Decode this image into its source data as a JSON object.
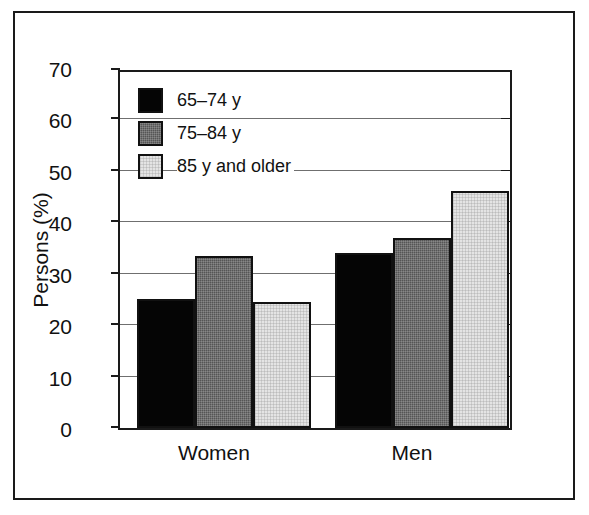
{
  "chart_data": {
    "type": "bar",
    "title": "",
    "xlabel": "",
    "ylabel": "Persons (%)",
    "categories": [
      "Women",
      "Men"
    ],
    "series": [
      {
        "name": "65–74 y",
        "values": [
          25.0,
          34.0
        ],
        "color": "#050505"
      },
      {
        "name": "75–84 y",
        "values": [
          33.5,
          37.0
        ],
        "color": "#555555"
      },
      {
        "name": "85 y and older",
        "values": [
          24.5,
          46.0
        ],
        "color": "#e4e4e4"
      }
    ],
    "ylim": [
      0,
      70
    ],
    "yticks": [
      0,
      10,
      20,
      30,
      40,
      50,
      60,
      70
    ],
    "ytick_labels": [
      "0",
      "10",
      "20",
      "30",
      "40",
      "50",
      "60",
      "70"
    ],
    "grid": true,
    "grid_axis": "y",
    "legend_position": "upper left inside plot"
  },
  "axis": {
    "y_title": "Persons (%)",
    "tick_labels": [
      "70",
      "60",
      "50",
      "40",
      "30",
      "20",
      "10",
      "0"
    ]
  },
  "legend": {
    "entries": [
      {
        "label": "65–74 y",
        "swatch": "black-swatch"
      },
      {
        "label": "75–84 y",
        "swatch": "dark-gray-swatch"
      },
      {
        "label": "85 y and older",
        "swatch": "light-gray-swatch"
      }
    ]
  },
  "categories": [
    {
      "label": "Women"
    },
    {
      "label": "Men"
    }
  ],
  "colors": {
    "black": "#050505",
    "dark_gray": "#555555",
    "light_gray": "#e4e4e4",
    "axis": "#1a1a1a",
    "gridline": "#6f6f6f",
    "background": "#ffffff"
  }
}
